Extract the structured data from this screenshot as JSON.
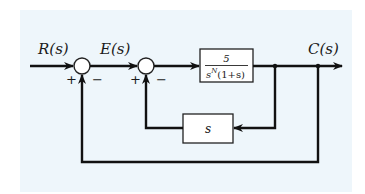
{
  "diagram": {
    "type": "feedback-control-block-diagram",
    "signals": {
      "input": "R(s)",
      "error": "E(s)",
      "output": "C(s)"
    },
    "summing_junctions": [
      {
        "id": "sum1",
        "input_sign": "+",
        "feedback_sign": "−"
      },
      {
        "id": "sum2",
        "input_sign": "+",
        "feedback_sign": "−"
      }
    ],
    "blocks": {
      "forward": {
        "numerator": "5",
        "denominator_base": "s",
        "denominator_exp": "N",
        "denominator_rest": "(1+s)"
      },
      "feedback": {
        "label": "s"
      }
    },
    "colors": {
      "background": "#eef6fb",
      "line": "#111111",
      "block_fill": "#ffffff"
    }
  }
}
